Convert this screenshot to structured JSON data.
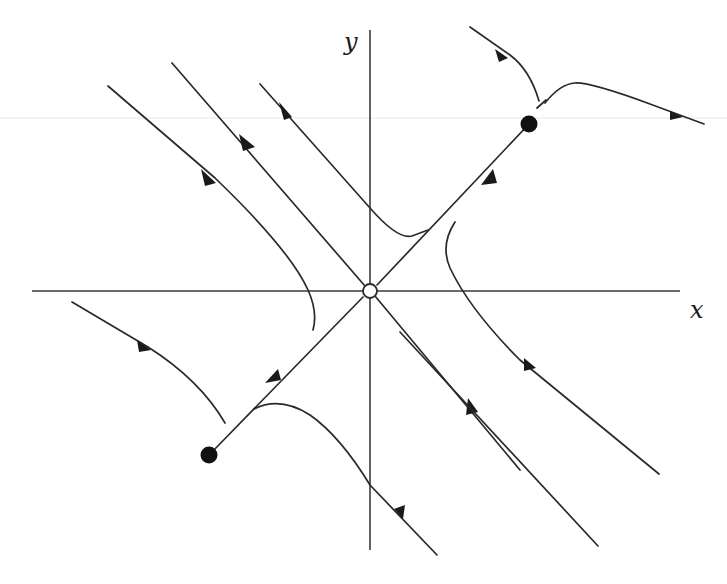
{
  "diagram": {
    "type": "phase-portrait",
    "axes": {
      "x_label": "x",
      "y_label": "y",
      "origin": [
        370,
        291
      ]
    },
    "equilibria": [
      {
        "name": "unstable-source-origin",
        "position": [
          370,
          291
        ],
        "fill": "open"
      },
      {
        "name": "stable-node-upper-right",
        "position": [
          529,
          124
        ],
        "fill": "solid"
      },
      {
        "name": "stable-node-lower-left",
        "position": [
          209,
          455
        ],
        "fill": "solid"
      }
    ],
    "colors": {
      "line": "#2a2a2a",
      "axis": "#3a3a3a",
      "background": "#ffffff"
    }
  }
}
